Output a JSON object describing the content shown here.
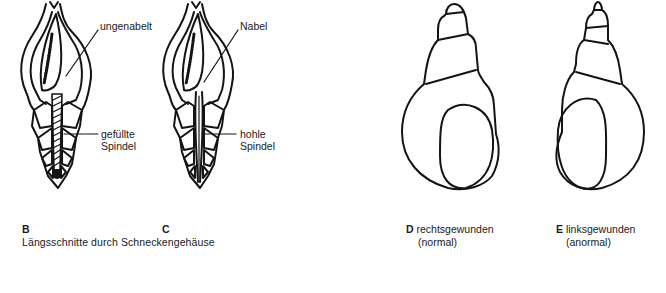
{
  "figure_B": {
    "letter": "B",
    "label_umbilicus": "ungenabelt",
    "label_spindle_1": "gefüllte",
    "label_spindle_2": "Spindel"
  },
  "figure_C": {
    "letter": "C",
    "label_umbilicus": "Nabel",
    "label_spindle_1": "hohle",
    "label_spindle_2": "Spindel"
  },
  "caption_BC": "Längsschnitte durch Schneckengehäuse",
  "figure_D": {
    "letter": "D",
    "label_1": "rechtsgewunden",
    "label_2": "(normal)"
  },
  "figure_E": {
    "letter": "E",
    "label_1": "linksgewunden",
    "label_2": "(anormal)"
  },
  "colors": {
    "ink": "#141414",
    "background": "#ffffff"
  }
}
